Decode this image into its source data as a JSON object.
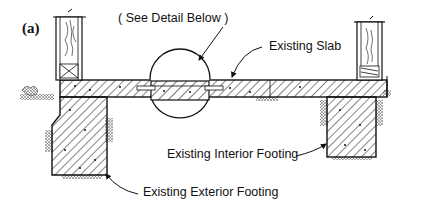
{
  "figure": {
    "letter": "(a)",
    "type": "section-detail"
  },
  "labels": {
    "detail_callout": "( See Detail Below )",
    "slab": "Existing Slab",
    "interior_footing": "Existing Interior Footing",
    "exterior_footing": "Existing Exterior Footing"
  },
  "colors": {
    "ink": "#111111",
    "background": "#ffffff",
    "earth": "#555555"
  },
  "icons": {
    "hatch": "concrete-hatch",
    "wood": "wood-grain",
    "earth": "earth-stipple"
  }
}
